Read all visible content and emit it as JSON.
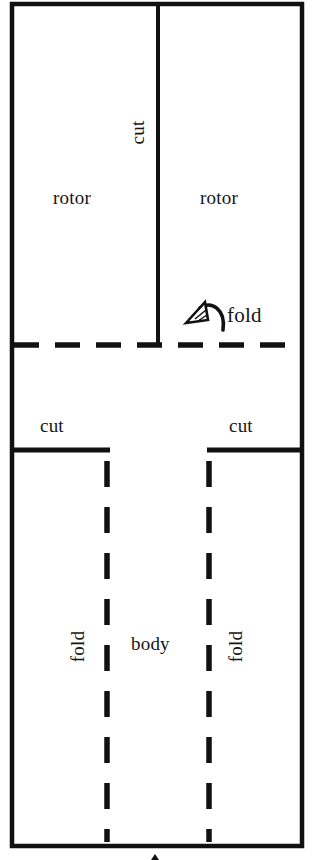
{
  "diagram": {
    "canvas": {
      "width": 320,
      "height": 860
    },
    "colors": {
      "background": "#ffffff",
      "ink": "#111111",
      "label_ink": "#161616"
    },
    "labels": {
      "rotor_left": "rotor",
      "rotor_right": "rotor",
      "cut_top": "cut",
      "fold_arrow": "fold",
      "cut_mid_left": "cut",
      "cut_mid_right": "cut",
      "body": "body",
      "fold_left": "fold",
      "fold_right": "fold"
    },
    "icons": {
      "fold_arrow": "curved-fold-arrow-icon",
      "bottom_tick": "bottom-arrow-tip-icon"
    },
    "lines": {
      "outer_border": {
        "style": "solid",
        "weight": 4
      },
      "rotor_split": {
        "style": "solid",
        "weight": 4,
        "meaning": "cut"
      },
      "horizontal_fold": {
        "style": "dashed",
        "weight": 5,
        "meaning": "fold"
      },
      "body_cut_left": {
        "style": "solid",
        "weight": 5,
        "meaning": "cut"
      },
      "body_cut_right": {
        "style": "solid",
        "weight": 5,
        "meaning": "cut"
      },
      "body_fold_left": {
        "style": "dashed",
        "weight": 5,
        "meaning": "fold"
      },
      "body_fold_right": {
        "style": "dashed",
        "weight": 5,
        "meaning": "fold"
      }
    }
  }
}
